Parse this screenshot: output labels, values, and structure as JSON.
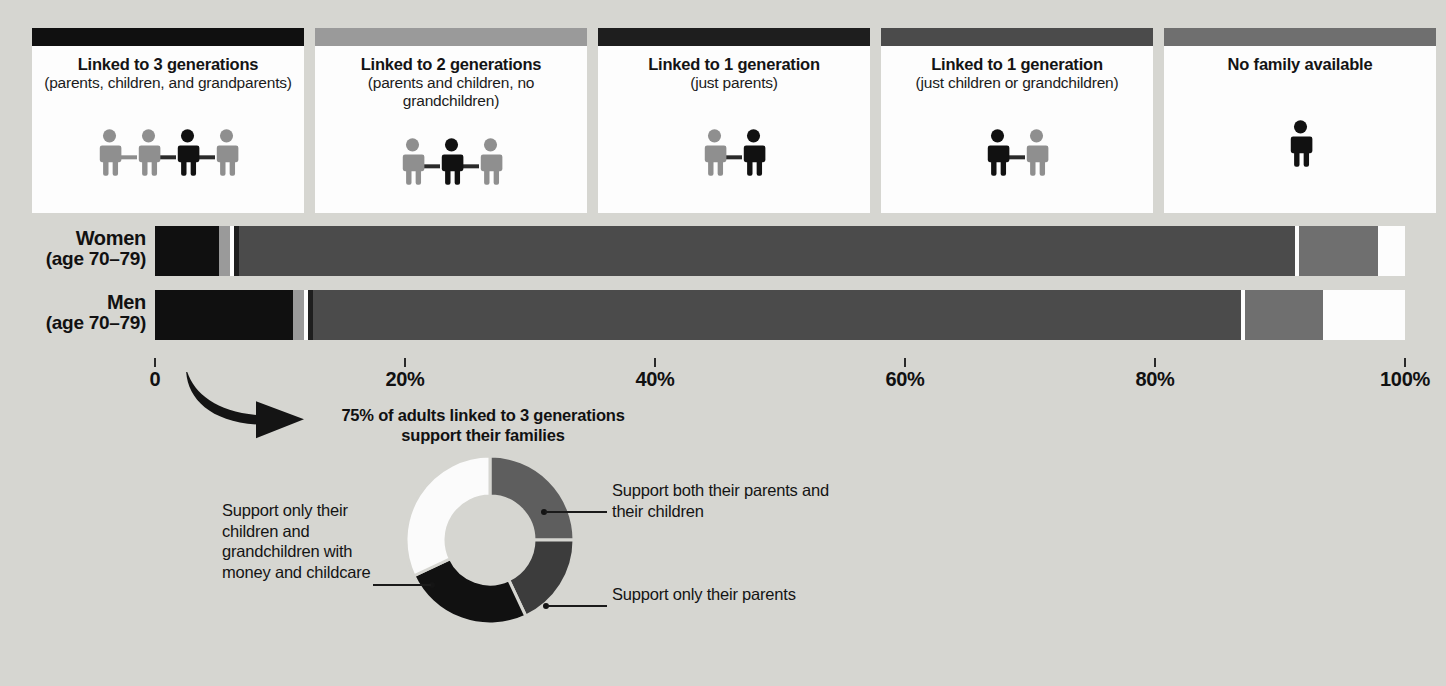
{
  "colors": {
    "background": "#d6d6d1",
    "card_bg": "#fdfdfd",
    "cat_3gen": "#101010",
    "cat_2gen": "#9a9a9a",
    "cat_1gen_parents": "#1e1e1e",
    "cat_1gen_children": "#4b4b4b",
    "cat_none": "#6f6f6f",
    "white_segment": "#fdfdfd",
    "text": "#141414"
  },
  "legend": {
    "cards": [
      {
        "swatch_color": "#101010",
        "title": "Linked to 3 generations",
        "subtitle": "(parents, children, and grandparents)",
        "icon": "four-people-chain-icon",
        "figure_count": 4,
        "highlight_index": 2
      },
      {
        "swatch_color": "#9a9a9a",
        "title": "Linked to 2 generations",
        "subtitle": "(parents and children, no grandchildren)",
        "icon": "three-people-chain-icon",
        "figure_count": 3,
        "highlight_index": 1
      },
      {
        "swatch_color": "#1e1e1e",
        "title": "Linked to 1 generation",
        "subtitle": "(just parents)",
        "icon": "two-people-chain-icon",
        "figure_count": 2,
        "highlight_index": 1
      },
      {
        "swatch_color": "#4b4b4b",
        "title": "Linked to 1 generation",
        "subtitle": "(just children or grandchildren)",
        "icon": "two-people-chain-icon",
        "figure_count": 2,
        "highlight_index": 0
      },
      {
        "swatch_color": "#6f6f6f",
        "title": "No family available",
        "subtitle": "",
        "icon": "single-person-icon",
        "figure_count": 1,
        "highlight_index": 0
      }
    ]
  },
  "chart_data": {
    "type": "bar",
    "orientation": "horizontal",
    "stacked": true,
    "normalized_percent": true,
    "title": "",
    "xlabel": "",
    "ylabel": "",
    "xlim": [
      0,
      100
    ],
    "grid": false,
    "legend_position": "top",
    "tick_values": [
      0,
      20,
      40,
      60,
      80,
      100
    ],
    "tick_labels": [
      "0",
      "20%",
      "40%",
      "60%",
      "80%",
      "100%"
    ],
    "categories": [
      "Women (age 70–79)",
      "Men (age 70–79)"
    ],
    "series": [
      {
        "name": "Linked to 3 generations (parents, children, and grandparents)",
        "color": "#101010",
        "values": [
          5.1,
          11.0
        ]
      },
      {
        "name": "Linked to 2 generations (parents and children, no grandchildren)",
        "color": "#9a9a9a",
        "values": [
          0.9,
          1.0
        ]
      },
      {
        "name": "Linked to 1 generation (just parents)",
        "color": "#1e1e1e",
        "values": [
          0.5,
          0.5
        ]
      },
      {
        "name": "Linked to 1 generation (just children or grandchildren)",
        "color": "#4b4b4b",
        "values": [
          84.5,
          74.5
        ]
      },
      {
        "name": "No family available",
        "color": "#6f6f6f",
        "values": [
          6.8,
          6.4
        ]
      },
      {
        "name": "Remainder",
        "color": "#fdfdfd",
        "values": [
          2.2,
          6.6
        ]
      }
    ]
  },
  "bars": [
    {
      "label_main": "Women",
      "label_sub": "(age 70–79)",
      "segments": [
        {
          "name": "linked-3-generations",
          "color": "#101010",
          "pct": 5.1
        },
        {
          "name": "linked-2-generations",
          "color": "#9a9a9a",
          "pct": 0.9
        },
        {
          "name": "gap",
          "color": "#fdfdfd",
          "pct": 0.3
        },
        {
          "name": "linked-1-generation-parents",
          "color": "#1e1e1e",
          "pct": 0.4
        },
        {
          "name": "linked-1-generation-children",
          "color": "#4b4b4b",
          "pct": 84.5
        },
        {
          "name": "gap-2",
          "color": "#fdfdfd",
          "pct": 0.3
        },
        {
          "name": "no-family-available",
          "color": "#6f6f6f",
          "pct": 6.3
        },
        {
          "name": "remainder",
          "color": "#fdfdfd",
          "pct": 2.2
        }
      ]
    },
    {
      "label_main": "Men",
      "label_sub": "(age 70–79)",
      "segments": [
        {
          "name": "linked-3-generations",
          "color": "#101010",
          "pct": 11.0
        },
        {
          "name": "linked-2-generations",
          "color": "#9a9a9a",
          "pct": 0.9
        },
        {
          "name": "gap",
          "color": "#fdfdfd",
          "pct": 0.3
        },
        {
          "name": "linked-1-generation-parents",
          "color": "#1e1e1e",
          "pct": 0.4
        },
        {
          "name": "linked-1-generation-children",
          "color": "#4b4b4b",
          "pct": 74.3
        },
        {
          "name": "gap-2",
          "color": "#fdfdfd",
          "pct": 0.3
        },
        {
          "name": "no-family-available",
          "color": "#6f6f6f",
          "pct": 6.2
        },
        {
          "name": "remainder",
          "color": "#fdfdfd",
          "pct": 6.6
        }
      ]
    }
  ],
  "callout": {
    "title_line_1": "75% of adults linked to 3 generations",
    "title_line_2": "support their families",
    "arrow_icon": "curved-arrow-icon",
    "donut": {
      "type": "pie",
      "donut": true,
      "values": [
        25,
        18,
        25,
        32
      ],
      "colors": [
        "#5e5e5e",
        "#3c3c3c",
        "#111111",
        "#fbfbfb"
      ],
      "labels": [
        "Support both their parents and their children",
        "Support only their parents",
        "Support only their children and grandchildren with money and childcare",
        ""
      ]
    },
    "labels": {
      "right_1": "Support both their parents and their children",
      "right_2": "Support only their parents",
      "left_1": "Support only their children and grandchildren with money and childcare"
    }
  }
}
